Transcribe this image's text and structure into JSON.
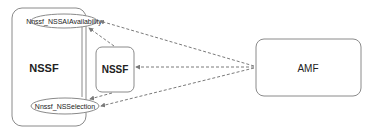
{
  "diagram": {
    "nssf_outer": {
      "label": "NSSF"
    },
    "service_top": {
      "label": "Nnssf_NSSAIAvailability"
    },
    "service_bottom": {
      "label": "Nnssf_NSSelection"
    },
    "nssf_inner": {
      "label": "NSSF"
    },
    "amf": {
      "label": "AMF"
    },
    "colors": {
      "stroke": "#8a8a8a",
      "text": "#222222",
      "dash": "#7a7a7a"
    },
    "edges": [
      {
        "from": "AMF",
        "to": "Nnssf_NSSAIAvailability",
        "style": "dashed"
      },
      {
        "from": "AMF",
        "to": "NSSF (inner)",
        "style": "dashed"
      },
      {
        "from": "AMF",
        "to": "Nnssf_NSSelection",
        "style": "dashed"
      },
      {
        "from": "NSSF (inner)",
        "to": "Nnssf_NSSAIAvailability",
        "style": "dashed"
      },
      {
        "from": "NSSF (inner)",
        "to": "Nnssf_NSSelection",
        "style": "dashed"
      }
    ]
  }
}
